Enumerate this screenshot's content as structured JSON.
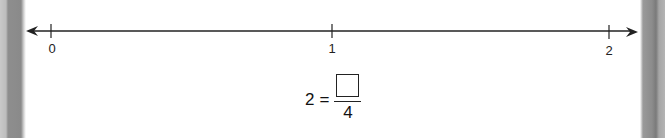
{
  "number_line": {
    "ticks": [
      {
        "value": 0,
        "label": "0"
      },
      {
        "value": 1,
        "label": "1"
      },
      {
        "value": 2,
        "label": "2"
      }
    ],
    "line_color": "#222222",
    "arrows": "both"
  },
  "equation": {
    "whole_number": "2",
    "equals": "=",
    "numerator": "",
    "denominator": "4"
  }
}
